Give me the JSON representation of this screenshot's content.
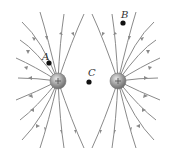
{
  "diagram": {
    "charges": [
      {
        "id": "left",
        "sign": "+",
        "cx": 58,
        "cy": 81,
        "r": 8
      },
      {
        "id": "right",
        "sign": "+",
        "cx": 118,
        "cy": 81,
        "r": 8
      }
    ],
    "points": [
      {
        "label": "A",
        "x": 49,
        "y": 63,
        "lx": 42,
        "ly": 52
      },
      {
        "label": "B",
        "x": 123,
        "y": 23,
        "lx": 121,
        "ly": 10
      },
      {
        "label": "C",
        "x": 89,
        "y": 82,
        "lx": 88,
        "ly": 68
      }
    ],
    "colors": {
      "field_line": "#8a8a8a",
      "charge": "#9a9a9a",
      "point": "#111111"
    }
  }
}
